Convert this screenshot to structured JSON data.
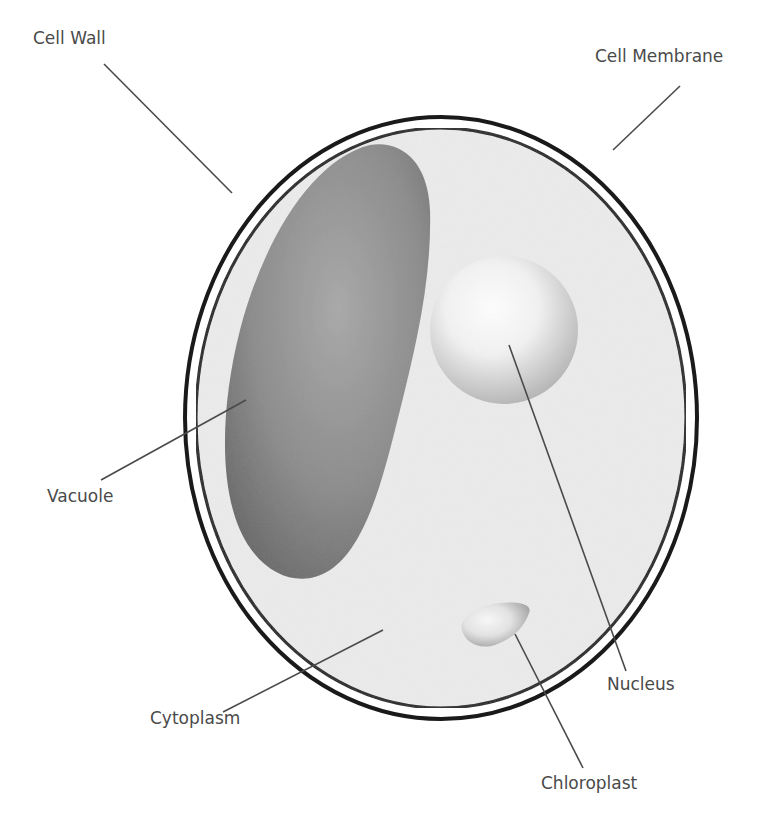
{
  "diagram": {
    "type": "labeled-illustration",
    "colors": {
      "background": "#ffffff",
      "wall_stroke": "#1a1a1a",
      "cytoplasm_fill": "#ececec",
      "vacuole_dark": "#6e6e6e",
      "vacuole_light": "#a8a8a8",
      "nucleus_light": "#ffffff",
      "nucleus_dark": "#b5b5b5",
      "chloroplast_light": "#f6f6f6",
      "chloroplast_dark": "#a0a0a0",
      "leader_line": "#4a4a4a",
      "label_text": "#4a4a4a"
    },
    "labels": [
      {
        "id": "cell-wall",
        "text": "Cell Wall",
        "x": 33,
        "y": 38,
        "line": [
          104,
          64,
          232,
          193
        ]
      },
      {
        "id": "cell-membrane",
        "text": "Cell Membrane",
        "x": 595,
        "y": 56,
        "line": [
          680,
          86,
          613,
          150
        ]
      },
      {
        "id": "vacuole",
        "text": "Vacuole",
        "x": 47,
        "y": 496,
        "line": [
          101,
          480,
          246,
          400
        ]
      },
      {
        "id": "cytoplasm",
        "text": "Cytoplasm",
        "x": 150,
        "y": 718,
        "line": [
          223,
          712,
          383,
          630
        ]
      },
      {
        "id": "nucleus",
        "text": "Nucleus",
        "x": 607,
        "y": 684,
        "line": [
          626,
          671,
          509,
          345
        ]
      },
      {
        "id": "chloroplast",
        "text": "Chloroplast",
        "x": 541,
        "y": 783,
        "line": [
          583,
          768,
          515,
          634
        ]
      }
    ]
  }
}
